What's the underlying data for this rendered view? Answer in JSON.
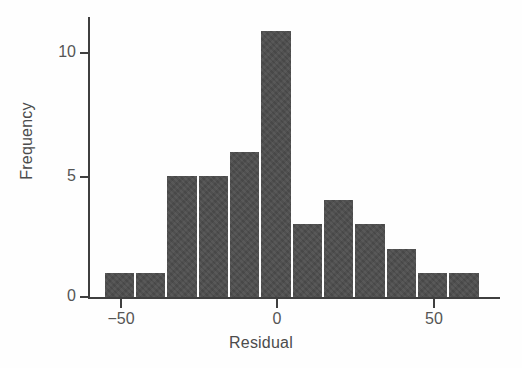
{
  "chart_data": {
    "type": "bar",
    "title": "",
    "subtitle": "",
    "xlabel": "Residual",
    "ylabel": "Frequency",
    "bin_width": 10,
    "bin_starts": [
      -55,
      -45,
      -35,
      -25,
      -15,
      -5,
      5,
      15,
      25,
      35,
      45,
      55
    ],
    "bin_ends": [
      -45,
      -35,
      -25,
      -15,
      -5,
      5,
      15,
      25,
      35,
      45,
      55,
      65
    ],
    "categories": [
      "-55 to -45",
      "-45 to -35",
      "-35 to -25",
      "-25 to -15",
      "-15 to -5",
      "-5 to 5",
      "5 to 15",
      "15 to 25",
      "25 to 35",
      "35 to 45",
      "45 to 55",
      "55 to 65"
    ],
    "values": [
      1,
      1,
      5,
      5,
      6,
      11,
      3,
      4,
      3,
      2,
      1,
      1
    ],
    "xlim": [
      -58,
      74
    ],
    "ylim": [
      0,
      11.7
    ],
    "xticks": [
      -50,
      0,
      50
    ],
    "xtick_labels": [
      "−50",
      "0",
      "50"
    ],
    "yticks": [
      0,
      5,
      10
    ],
    "ytick_labels": [
      "0",
      "5",
      "10"
    ],
    "grid": false,
    "legend": null,
    "bar_color": "#4d4d4d",
    "axis_color": "#3f3f3f",
    "text_color": "#4c4c4c",
    "background_color": "#fefefe",
    "total_count": 39
  }
}
